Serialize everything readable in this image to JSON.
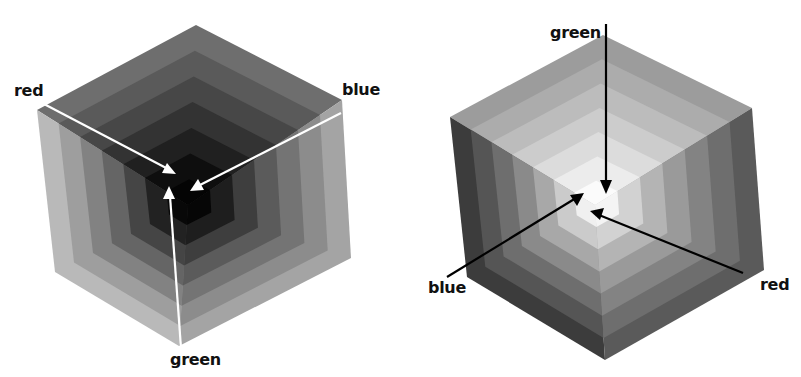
{
  "figure": {
    "left_cube": {
      "description": "RGB cube viewed from the black corner; layers lighten outward",
      "center_color": "#000000",
      "labels": {
        "red": "red",
        "blue": "blue",
        "green": "green"
      },
      "arrow_color": "#ffffff"
    },
    "right_cube": {
      "description": "RGB cube viewed from the white corner; layers darken outward",
      "center_color": "#ffffff",
      "labels": {
        "green": "green",
        "blue": "blue",
        "red": "red"
      },
      "arrow_color": "#000000"
    }
  }
}
